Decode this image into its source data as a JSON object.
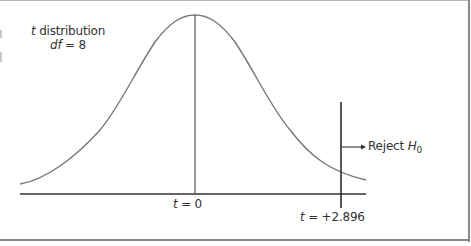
{
  "diagram": {
    "distribution": {
      "name_var": "t",
      "name_text": " distribution",
      "df_var": "df",
      "df_text": " = 8"
    },
    "center_marker": {
      "var": "t",
      "text": " = 0"
    },
    "critical_marker": {
      "var": "t",
      "text": " = +2.896"
    },
    "reject_region": {
      "text": "Reject ",
      "var": "H",
      "subscript": "0"
    },
    "colors": {
      "curve": "#777777",
      "lines": "#333333",
      "frame": "#888888",
      "text": "#333333"
    }
  }
}
